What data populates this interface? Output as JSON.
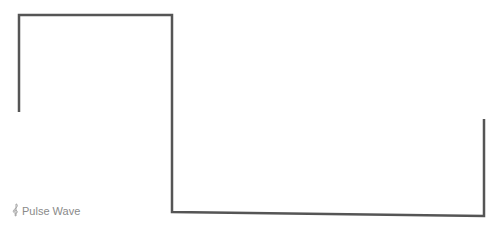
{
  "diagram": {
    "type": "pulse-wave",
    "stroke_color": "#555555",
    "points": [
      [
        19,
        112
      ],
      [
        19,
        15
      ],
      [
        172,
        15
      ],
      [
        172,
        212
      ],
      [
        484,
        216
      ],
      [
        484,
        119
      ]
    ]
  },
  "caption": {
    "icon": "treble-clef-icon",
    "label": "Pulse Wave",
    "color": "#8a8a8a"
  }
}
